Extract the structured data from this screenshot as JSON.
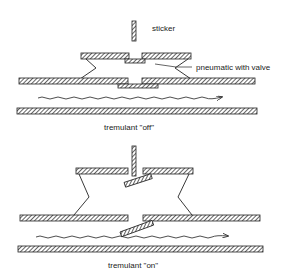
{
  "diagram": {
    "type": "mechanical-cross-section",
    "panels": [
      {
        "id": "off",
        "caption": "tremulant \"off\"",
        "labels": {
          "sticker": "sticker",
          "pneumatic": "pneumatic with valve"
        },
        "state": "valves closed, sticker raised"
      },
      {
        "id": "on",
        "caption": "tremulant \"on\"",
        "state": "valves tilted open, sticker lowered"
      }
    ],
    "colors": {
      "ink": "#222222",
      "background": "#ffffff"
    }
  }
}
